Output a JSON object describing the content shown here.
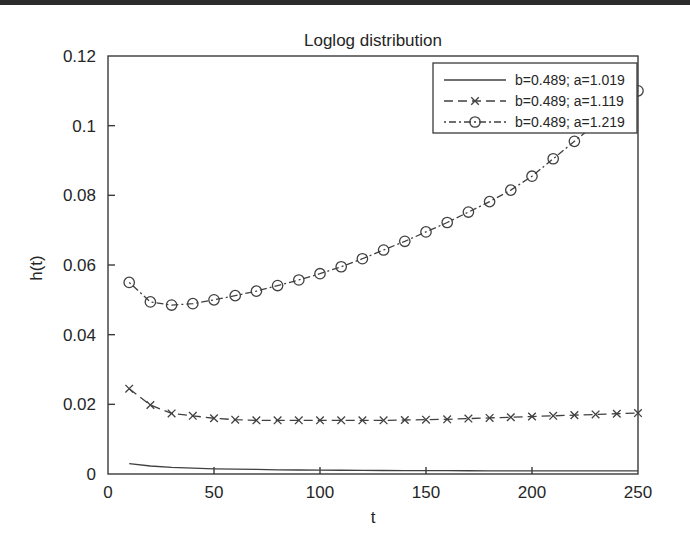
{
  "figure": {
    "title": "Loglog distribution",
    "xlabel": "t",
    "ylabel": "h(t)"
  },
  "axes": {
    "x_ticks": [
      "0",
      "50",
      "100",
      "150",
      "200",
      "250"
    ],
    "y_ticks": [
      "0",
      "0.02",
      "0.04",
      "0.06",
      "0.08",
      "0.1",
      "0.12"
    ]
  },
  "legend": {
    "entries": [
      {
        "label": "b=0.489; a=1.019",
        "style": "solid",
        "marker": "none"
      },
      {
        "label": "b=0.489; a=1.119",
        "style": "dashed",
        "marker": "x"
      },
      {
        "label": "b=0.489; a=1.219",
        "style": "dotted-dashed",
        "marker": "circle"
      }
    ]
  },
  "colors": {
    "line": "#404040",
    "axis": "#3a3a3a",
    "text": "#262626",
    "background": "#ffffff"
  },
  "chart_data": {
    "type": "line",
    "title": "Loglog distribution",
    "xlabel": "t",
    "ylabel": "h(t)",
    "xlim": [
      0,
      250
    ],
    "ylim": [
      0,
      0.12
    ],
    "grid": false,
    "legend_position": "upper right",
    "x": [
      10,
      20,
      30,
      40,
      50,
      60,
      70,
      80,
      90,
      100,
      110,
      120,
      130,
      140,
      150,
      160,
      170,
      180,
      190,
      200,
      210,
      220,
      230,
      240,
      250
    ],
    "series": [
      {
        "name": "b=0.489; a=1.019",
        "marker": "none",
        "linestyle": "solid",
        "values": [
          0.003,
          0.0023,
          0.0019,
          0.0017,
          0.0015,
          0.0014,
          0.0013,
          0.0012,
          0.00115,
          0.0011,
          0.00107,
          0.00104,
          0.00101,
          0.00099,
          0.00097,
          0.00095,
          0.00093,
          0.00092,
          0.00091,
          0.0009,
          0.00089,
          0.00088,
          0.00088,
          0.00087,
          0.00087
        ]
      },
      {
        "name": "b=0.489; a=1.119",
        "marker": "x",
        "linestyle": "dashed",
        "values": [
          0.0245,
          0.0198,
          0.0174,
          0.0167,
          0.016,
          0.0156,
          0.0154,
          0.0154,
          0.0154,
          0.0154,
          0.0154,
          0.0154,
          0.0154,
          0.0155,
          0.0156,
          0.0157,
          0.0159,
          0.0161,
          0.0163,
          0.0165,
          0.0167,
          0.0169,
          0.0171,
          0.0173,
          0.0175
        ]
      },
      {
        "name": "b=0.489; a=1.219",
        "marker": "circle",
        "linestyle": "dotted-dashed",
        "values": [
          0.055,
          0.0494,
          0.0485,
          0.0489,
          0.05,
          0.0512,
          0.0525,
          0.0541,
          0.0557,
          0.0575,
          0.0595,
          0.0618,
          0.0643,
          0.0668,
          0.0695,
          0.0722,
          0.0752,
          0.0782,
          0.0815,
          0.0855,
          0.0905,
          0.0955,
          0.1005,
          0.1055,
          0.11
        ]
      }
    ]
  }
}
